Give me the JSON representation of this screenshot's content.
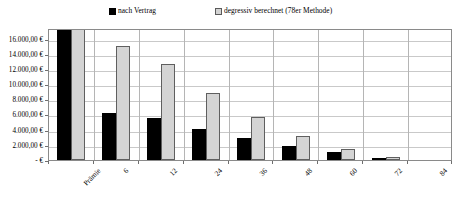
{
  "chart_data": {
    "type": "bar",
    "title": "",
    "subtitle": "",
    "xlabel": "",
    "ylabel": "",
    "categories": [
      "Prämie",
      "6",
      "12",
      "24",
      "36",
      "48",
      "60",
      "72",
      "84"
    ],
    "series": [
      {
        "name": "nach Vertrag",
        "color": "#000000",
        "values": [
          17400,
          6150,
          5500,
          4150,
          2950,
          1900,
          1000,
          300,
          0
        ]
      },
      {
        "name": "degressiv berechnet (78er Methode)",
        "color": "#d4d4d4",
        "values": [
          17400,
          15000,
          12700,
          8850,
          5650,
          3200,
          1450,
          350,
          0
        ]
      }
    ],
    "ylim": [
      0,
      17400
    ],
    "y_ticks": [
      0,
      2000,
      4000,
      6000,
      8000,
      10000,
      12000,
      14000,
      16000
    ],
    "y_tick_labels": [
      "-   €",
      "2.000,00 €",
      "4.000,00 €",
      "6.000,00 €",
      "8.000,00 €",
      "10.000,00 €",
      "12.000,00 €",
      "14.000,00 €",
      "16.000,00 €"
    ],
    "grid": true,
    "legend_position": "top"
  },
  "legend": {
    "entries": [
      {
        "label": "nach Vertrag",
        "swatch": "black-square-swatch"
      },
      {
        "label": "degressiv berechnet (78er Methode)",
        "swatch": "grey-square-swatch"
      }
    ]
  }
}
